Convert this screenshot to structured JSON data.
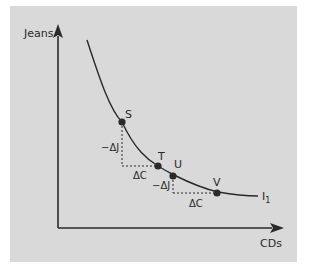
{
  "diagram": {
    "type": "indifference-curve",
    "y_axis_label": "Jeans",
    "x_axis_label": "CDs",
    "curve_label": "I",
    "curve_label_subscript": "1",
    "points": [
      {
        "label": "S"
      },
      {
        "label": "T"
      },
      {
        "label": "U"
      },
      {
        "label": "V"
      }
    ],
    "delta_labels": {
      "delta_j_1": "−ΔJ",
      "delta_c_1": "ΔC",
      "delta_j_2": "−ΔJ",
      "delta_c_2": "ΔC"
    },
    "colors": {
      "background": "#d9d9d9",
      "ink": "#2a2a2a"
    }
  }
}
